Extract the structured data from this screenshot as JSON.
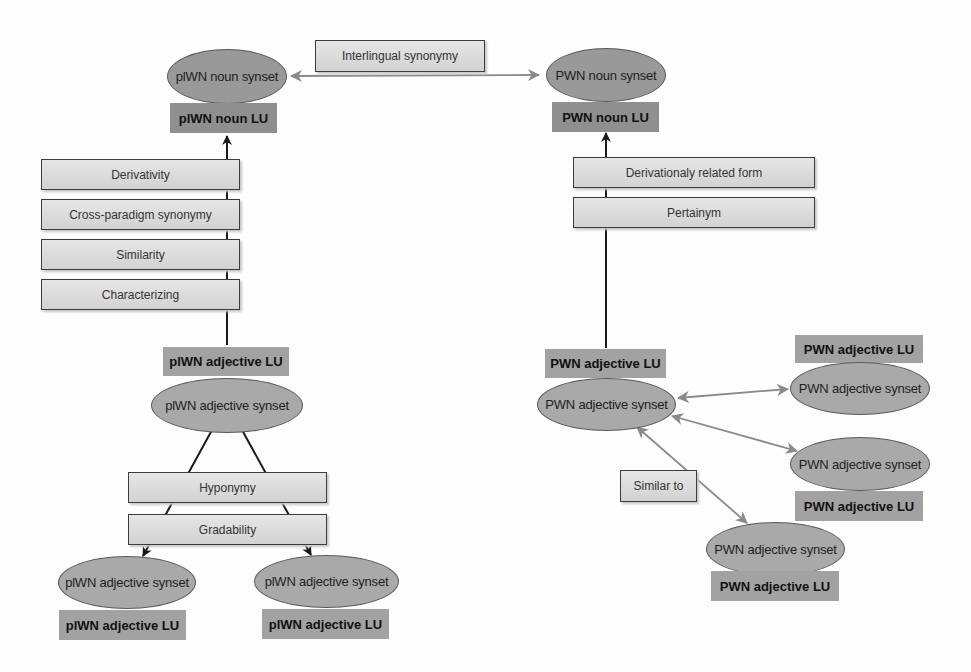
{
  "figure": {
    "nodes": {
      "plwn_noun_synset": "plWN noun synset",
      "plwn_noun_lu": "plWN noun LU",
      "pwn_noun_synset": "PWN noun synset",
      "pwn_noun_lu": "PWN noun LU",
      "plwn_adj_lu_top": "plWN adjective LU",
      "plwn_adj_synset_top": "plWN adjective synset",
      "plwn_adj_synset_left": "plWN adjective synset",
      "plwn_adj_lu_left": "plWN adjective LU",
      "plwn_adj_synset_right": "plWN adjective synset",
      "plwn_adj_lu_right": "plWN adjective LU",
      "pwn_adj_lu_main": "PWN adjective LU",
      "pwn_adj_synset_main": "PWN adjective synset",
      "pwn_adj_lu_r1": "PWN adjective LU",
      "pwn_adj_synset_r1": "PWN adjective synset",
      "pwn_adj_synset_r2": "PWN adjective synset",
      "pwn_adj_lu_r2": "PWN adjective LU",
      "pwn_adj_synset_r3": "PWN adjective synset",
      "pwn_adj_lu_r3": "PWN adjective LU"
    },
    "relations": {
      "interlingual_synonymy": "Interlingual synonymy",
      "plwn_adj_to_noun": [
        "Derivativity",
        "Cross-paradigm synonymy",
        "Similarity",
        "Characterizing"
      ],
      "pwn_adj_to_noun": [
        "Derivationaly related form",
        "Pertainym"
      ],
      "plwn_adj_internal": [
        "Hyponymy",
        "Gradability"
      ],
      "pwn_adj_internal": "Similar to"
    },
    "colors": {
      "synset_fill": "#a9a9a9",
      "lu_fill": "#a2a2a2",
      "relation_box_fill": "#dcdcdc",
      "dark_arrow": "#1a1a1a",
      "gray_arrow": "#8a8a8a"
    }
  }
}
